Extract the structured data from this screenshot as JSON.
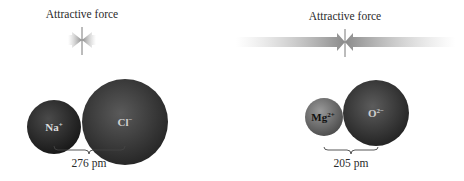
{
  "panels": [
    {
      "id": "nacl",
      "force_label": "Attractive force",
      "cation": {
        "symbol": "Na",
        "charge": "+",
        "color": "#2a2a2a"
      },
      "anion": {
        "symbol": "Cl",
        "charge": "−",
        "color": "#3c3c3c"
      },
      "distance_label": "276 pm"
    },
    {
      "id": "mgo",
      "force_label": "Attractive force",
      "cation": {
        "symbol": "Mg",
        "charge": "2+",
        "color": "#707070"
      },
      "anion": {
        "symbol": "O",
        "charge": "2−",
        "color": "#3a3a3a"
      },
      "distance_label": "205 pm"
    }
  ],
  "colors": {
    "arrow": "#9a9a9a",
    "background": "#ffffff"
  }
}
